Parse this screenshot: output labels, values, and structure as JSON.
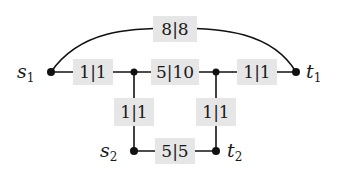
{
  "diagram": {
    "type": "flow-network",
    "nodes": {
      "s1": {
        "name": "s",
        "sub": "1"
      },
      "t1": {
        "name": "t",
        "sub": "1"
      },
      "s2": {
        "name": "s",
        "sub": "2"
      },
      "t2": {
        "name": "t",
        "sub": "2"
      }
    },
    "edges": {
      "arc_s1_t1": {
        "label": "8|8",
        "flow": 8,
        "capacity": 8
      },
      "s1_a": {
        "label": "1|1",
        "flow": 1,
        "capacity": 1
      },
      "a_b": {
        "label": "5|10",
        "flow": 5,
        "capacity": 10
      },
      "b_t1": {
        "label": "1|1",
        "flow": 1,
        "capacity": 1
      },
      "a_s2": {
        "label": "1|1",
        "flow": 1,
        "capacity": 1
      },
      "b_t2": {
        "label": "1|1",
        "flow": 1,
        "capacity": 1
      },
      "s2_t2": {
        "label": "5|5",
        "flow": 5,
        "capacity": 5
      }
    },
    "colors": {
      "edge": "#111111",
      "label_background": "#e6e6e6",
      "text": "#1a1a1a"
    }
  }
}
